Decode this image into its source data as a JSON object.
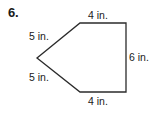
{
  "problem": {
    "number": "6."
  },
  "figure": {
    "shape_name": "pentagon",
    "stroke_color": "#2b2b2b",
    "fill_color": "#ffffff",
    "vertices": [
      {
        "name": "top-left-vertex",
        "x": 80,
        "y": 23
      },
      {
        "name": "top-right-vertex",
        "x": 126,
        "y": 23
      },
      {
        "name": "bottom-right-vertex",
        "x": 126,
        "y": 92
      },
      {
        "name": "bottom-left-vertex",
        "x": 80,
        "y": 92
      },
      {
        "name": "left-point-vertex",
        "x": 37,
        "y": 58
      }
    ],
    "labels": {
      "top_left_side": "5 in.",
      "top_side": "4 in.",
      "right_side": "6 in.",
      "bottom_side": "4 in.",
      "bottom_left_side": "5 in."
    }
  }
}
